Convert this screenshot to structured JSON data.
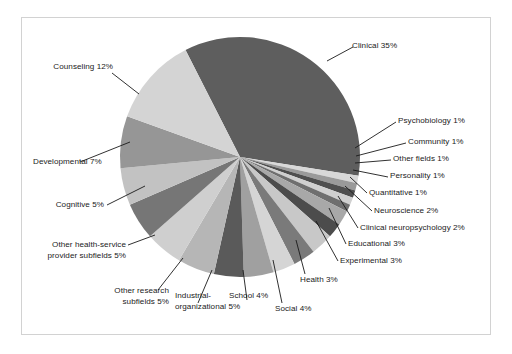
{
  "figure": {
    "background_color": "#ffffff",
    "frame_color": "#d2d2d2"
  },
  "chart_data": {
    "type": "pie",
    "title": "",
    "subtitle": "",
    "xlabel": "",
    "ylabel": "",
    "legend_position": "none",
    "grid": false,
    "label_format": "{name} {value}%",
    "start_angle_deg_from_top": -27,
    "direction": "clockwise",
    "center_px": [
      240,
      157
    ],
    "radius_px": 120,
    "categories": [
      "Clinical",
      "Psychobiology",
      "Community",
      "Other fields",
      "Personality",
      "Quantitative",
      "Neuroscience",
      "Clinical neuropsychology",
      "Educational",
      "Experimental",
      "Health",
      "Social",
      "School",
      "Industrial-organizational",
      "Other research subfields",
      "Other health-service provider subfields",
      "Cognitive",
      "Developmental",
      "Counseling"
    ],
    "values": [
      35,
      1,
      1,
      1,
      1,
      1,
      2,
      2,
      3,
      3,
      3,
      4,
      4,
      5,
      5,
      5,
      5,
      7,
      12
    ],
    "colors": [
      "#5e5e5e",
      "#d8d8d8",
      "#9a9a9a",
      "#4f4f4f",
      "#d0d0d0",
      "#6f6f6f",
      "#a8a8a8",
      "#4c4c4c",
      "#c8c8c8",
      "#7a7a7a",
      "#d5d5d5",
      "#a0a0a0",
      "#5a5a5a",
      "#b6b6b6",
      "#cfcfcf",
      "#767676",
      "#c2c2c2",
      "#969696",
      "#d4d4d4"
    ],
    "slices": [
      {
        "name": "Clinical",
        "value": 35,
        "label": "Clinical 35%"
      },
      {
        "name": "Psychobiology",
        "value": 1,
        "label": "Psychobiology 1%"
      },
      {
        "name": "Community",
        "value": 1,
        "label": "Community 1%"
      },
      {
        "name": "Other fields",
        "value": 1,
        "label": "Other fields 1%"
      },
      {
        "name": "Personality",
        "value": 1,
        "label": "Personality 1%"
      },
      {
        "name": "Quantitative",
        "value": 1,
        "label": "Quantitative 1%"
      },
      {
        "name": "Neuroscience",
        "value": 2,
        "label": "Neuroscience 2%"
      },
      {
        "name": "Clinical neuropsychology",
        "value": 2,
        "label": "Clinical neuropsychology 2%"
      },
      {
        "name": "Educational",
        "value": 3,
        "label": "Educational 3%"
      },
      {
        "name": "Experimental",
        "value": 3,
        "label": "Experimental 3%"
      },
      {
        "name": "Health",
        "value": 3,
        "label": "Health 3%"
      },
      {
        "name": "Social",
        "value": 4,
        "label": "Social 4%"
      },
      {
        "name": "School",
        "value": 4,
        "label": "School 4%"
      },
      {
        "name": "Industrial-organizational",
        "value": 5,
        "label": "Industrial-organizational 5%"
      },
      {
        "name": "Other research subfields",
        "value": 5,
        "label": "Other research subfields 5%"
      },
      {
        "name": "Other health-service provider subfields",
        "value": 5,
        "label": "Other health-service provider subfields 5%"
      },
      {
        "name": "Cognitive",
        "value": 5,
        "label": "Cognitive 5%"
      },
      {
        "name": "Developmental",
        "value": 7,
        "label": "Developmental 7%"
      },
      {
        "name": "Counseling",
        "value": 12,
        "label": "Counseling 12%"
      }
    ],
    "total": 100
  },
  "labels": {
    "clinical": "Clinical 35%",
    "psychobiology": "Psychobiology 1%",
    "community": "Community 1%",
    "other_fields": "Other fields 1%",
    "personality": "Personality 1%",
    "quantitative": "Quantitative 1%",
    "neuroscience": "Neuroscience 2%",
    "clinical_neuropsychology": "Clinical neuropsychology 2%",
    "educational": "Educational 3%",
    "experimental": "Experimental 3%",
    "health": "Health 3%",
    "social": "Social 4%",
    "school": "School 4%",
    "industrial_organizational_line1": "Industrial-",
    "industrial_organizational_line2": "organizational 5%",
    "other_research_line1": "Other research",
    "other_research_line2": "subfields 5%",
    "other_hsp_line1": "Other health-service",
    "other_hsp_line2": "provider subfields 5%",
    "cognitive": "Cognitive 5%",
    "developmental": "Developmental 7%",
    "counseling": "Counseling 12%"
  }
}
